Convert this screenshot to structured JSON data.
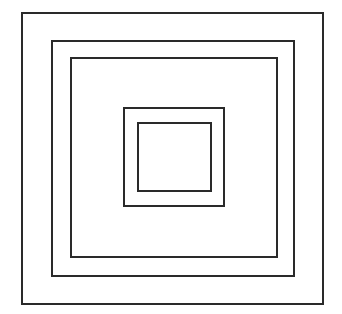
{
  "diagram": {
    "type": "nested-squares",
    "background": "#ffffff",
    "stroke_color": "#2a2a2a",
    "squares": [
      {
        "name": "square-1-outer",
        "left": 21,
        "top": 12,
        "width": 303,
        "height": 293
      },
      {
        "name": "square-2",
        "left": 51,
        "top": 40,
        "width": 244,
        "height": 237
      },
      {
        "name": "square-3",
        "left": 70,
        "top": 57,
        "width": 208,
        "height": 201
      },
      {
        "name": "square-4",
        "left": 123,
        "top": 107,
        "width": 102,
        "height": 100
      },
      {
        "name": "square-5-inner",
        "left": 137,
        "top": 122,
        "width": 75,
        "height": 70
      }
    ]
  }
}
